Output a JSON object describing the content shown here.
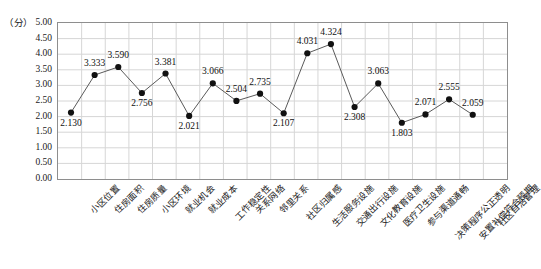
{
  "chart_data": {
    "type": "line",
    "title": "",
    "xlabel": "",
    "ylabel": "",
    "unit_label": "（分）",
    "ylim": [
      0.0,
      5.0
    ],
    "ystep": 0.5,
    "grid": true,
    "legend": false,
    "marker": "filled-circle",
    "categories": [
      "小区位置",
      "住房面积",
      "住房质量",
      "小区环境",
      "就业机会",
      "就业成本",
      "工作稳定性",
      "关系网络",
      "邻里关系",
      "社区归属感",
      "生活服务设施",
      "交通出行设施",
      "文化教育设施",
      "医疗卫生设施",
      "参与渠道通畅",
      "决策程序公正透明",
      "安置补偿符合预期",
      "社区自治管理"
    ],
    "values": [
      2.13,
      3.333,
      3.59,
      2.756,
      3.381,
      2.021,
      3.066,
      2.504,
      2.735,
      2.107,
      4.031,
      4.324,
      2.308,
      3.063,
      1.803,
      2.071,
      2.555,
      2.059
    ],
    "value_labels": [
      "2.130",
      "3.333",
      "3.590",
      "2.756",
      "3.381",
      "2.021",
      "3.066",
      "2.504",
      "2.735",
      "2.107",
      "4.031",
      "4.324",
      "2.308",
      "3.063",
      "1.803",
      "2.071",
      "2.555",
      "2.059"
    ],
    "label_positions": [
      "below",
      "above",
      "above",
      "below",
      "above",
      "below",
      "above",
      "above",
      "above",
      "below",
      "above",
      "above",
      "below",
      "above",
      "below",
      "above",
      "above",
      "above"
    ],
    "ytick_labels": [
      "5.00",
      "4.50",
      "4.00",
      "3.50",
      "3.00",
      "2.50",
      "2.00",
      "1.50",
      "1.00",
      "0.50",
      "0.00"
    ],
    "ytick_values": [
      5.0,
      4.5,
      4.0,
      3.5,
      3.0,
      2.5,
      2.0,
      1.5,
      1.0,
      0.5,
      0.0
    ],
    "colors": {
      "line": "#5a5a5a",
      "marker": "#111111",
      "grid": "#d6d6d6",
      "axis": "#8e8e8e",
      "text": "#1a1a1a",
      "background": "#ffffff"
    }
  }
}
